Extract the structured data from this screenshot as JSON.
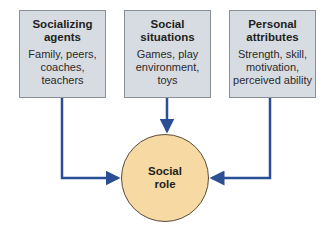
{
  "diagram": {
    "boxes": [
      {
        "title": "Socializing agents",
        "title_lines": [
          "Socializing",
          "agents"
        ],
        "description_lines": [
          "Family, peers,",
          "coaches,",
          "teachers"
        ]
      },
      {
        "title": "Social situations",
        "title_lines": [
          "Social",
          "situations"
        ],
        "description_lines": [
          "Games, play",
          "environment,",
          "toys"
        ]
      },
      {
        "title": "Personal attributes",
        "title_lines": [
          "Personal",
          "attributes"
        ],
        "description_lines": [
          "Strength, skill,",
          "motivation,",
          "perceived ability"
        ]
      }
    ],
    "center": {
      "label_lines": [
        "Social",
        "role"
      ]
    },
    "colors": {
      "box_fill": "#d6dce2",
      "circle_fill": "#f6d9a3",
      "arrow": "#2a4f94"
    }
  }
}
